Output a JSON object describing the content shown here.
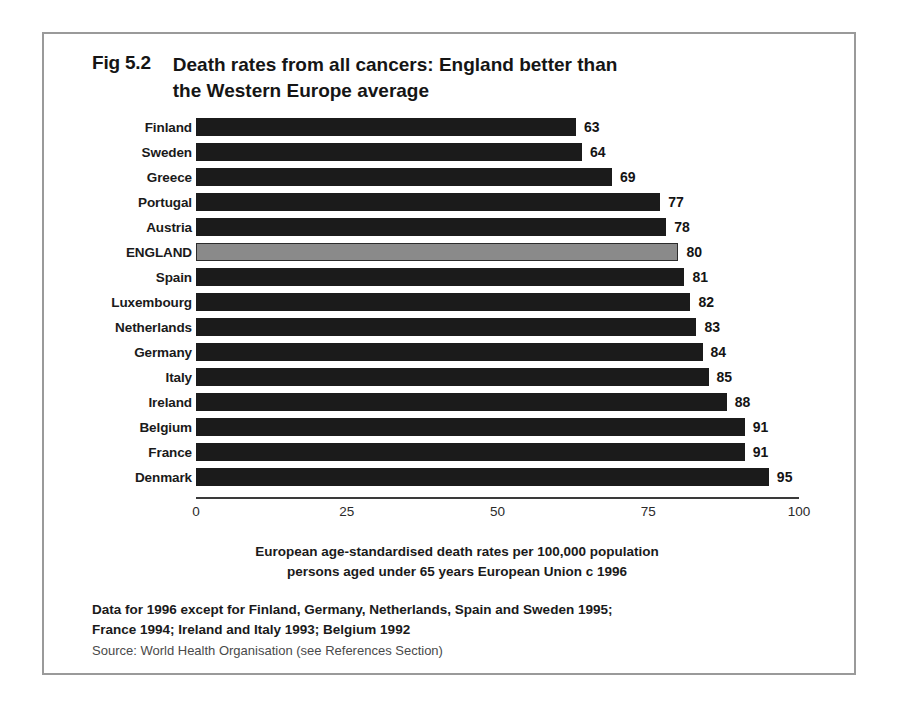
{
  "figure": {
    "number": "Fig 5.2",
    "title_line1": "Death rates from all cancers:  England better than",
    "title_line2": "the Western Europe average"
  },
  "chart_data": {
    "type": "bar",
    "orientation": "horizontal",
    "title": "Death rates from all cancers: England better than the Western Europe average",
    "xlabel": "European age-standardised death rates per 100,000 population persons aged under 65 years European Union c 1996",
    "ylabel": "",
    "xlim": [
      0,
      100
    ],
    "xticks": [
      0,
      25,
      50,
      75,
      100
    ],
    "xtick_labels": [
      "0",
      "25",
      "50",
      "75",
      "100"
    ],
    "grid": false,
    "legend": false,
    "highlight_category": "ENGLAND",
    "highlight_color": "#8a8a8a",
    "bar_color": "#1b1b1b",
    "categories": [
      "Finland",
      "Sweden",
      "Greece",
      "Portugal",
      "Austria",
      "ENGLAND",
      "Spain",
      "Luxembourg",
      "Netherlands",
      "Germany",
      "Italy",
      "Ireland",
      "Belgium",
      "France",
      "Denmark"
    ],
    "values": [
      63,
      64,
      69,
      77,
      78,
      80,
      81,
      82,
      83,
      84,
      85,
      88,
      91,
      91,
      95
    ],
    "bars": [
      {
        "label": "Finland",
        "value": 63,
        "value_label": "63",
        "highlight": false
      },
      {
        "label": "Sweden",
        "value": 64,
        "value_label": "64",
        "highlight": false
      },
      {
        "label": "Greece",
        "value": 69,
        "value_label": "69",
        "highlight": false
      },
      {
        "label": "Portugal",
        "value": 77,
        "value_label": "77",
        "highlight": false
      },
      {
        "label": "Austria",
        "value": 78,
        "value_label": "78",
        "highlight": false
      },
      {
        "label": "ENGLAND",
        "value": 80,
        "value_label": "80",
        "highlight": true
      },
      {
        "label": "Spain",
        "value": 81,
        "value_label": "81",
        "highlight": false
      },
      {
        "label": "Luxembourg",
        "value": 82,
        "value_label": "82",
        "highlight": false
      },
      {
        "label": "Netherlands",
        "value": 83,
        "value_label": "83",
        "highlight": false
      },
      {
        "label": "Germany",
        "value": 84,
        "value_label": "84",
        "highlight": false
      },
      {
        "label": "Italy",
        "value": 85,
        "value_label": "85",
        "highlight": false
      },
      {
        "label": "Ireland",
        "value": 88,
        "value_label": "88",
        "highlight": false
      },
      {
        "label": "Belgium",
        "value": 91,
        "value_label": "91",
        "highlight": false
      },
      {
        "label": "France",
        "value": 91,
        "value_label": "91",
        "highlight": false
      },
      {
        "label": "Denmark",
        "value": 95,
        "value_label": "95",
        "highlight": false
      }
    ]
  },
  "caption": {
    "line1": "European age-standardised death rates per 100,000 population",
    "line2": "persons aged under 65 years European Union c 1996"
  },
  "footnotes": {
    "note_line1": "Data for 1996 except for Finland, Germany, Netherlands, Spain and Sweden 1995;",
    "note_line2": "France 1994; Ireland and Italy 1993; Belgium 1992",
    "source": "Source: World Health Organisation (see References Section)"
  }
}
